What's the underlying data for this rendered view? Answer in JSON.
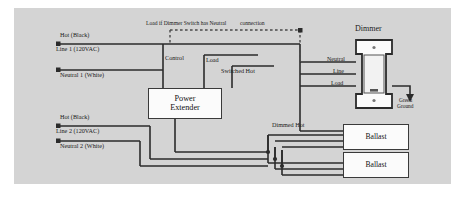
{
  "diagram": {
    "background_color": "#d4d4d4",
    "wire_color": "#2b2b2b",
    "box_fill": "#fbfbfb",
    "nodes": {
      "power_extender": {
        "line1": "Power",
        "line2": "Extender"
      },
      "dimmer": {
        "title": "Dimmer"
      },
      "ballast_1": {
        "label": "Ballast"
      },
      "ballast_2": {
        "label": "Ballast"
      }
    },
    "labels": {
      "hot_black_1": "Hot (Black)",
      "line_1": "Line 1 (120VAC)",
      "neutral_1": "Neutral 1 (White)",
      "hot_black_2": "Hot (Black)",
      "line_2": "Line 2 (120VAC)",
      "neutral_2": "Neutral 2 (White)",
      "control": "Control",
      "load": "Load",
      "switched_hot": "Switched Hot",
      "dimmed_hot": "Dimmed Hot",
      "dashed_note_left": "Load if Dimmer Switch has Neutral",
      "dashed_note_right": "connection",
      "dimmer_neutral": "Neutral",
      "dimmer_line": "Line",
      "dimmer_load": "Load",
      "green_ground_line1": "Green",
      "green_ground_line2": "Ground"
    }
  }
}
